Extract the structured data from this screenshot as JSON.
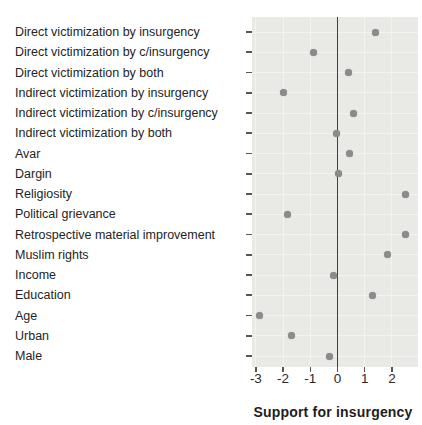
{
  "chart_data": {
    "type": "scatter",
    "subtype": "horizontal-dot-plot",
    "title": "",
    "xlabel": "Support for insurgency",
    "ylabel": "",
    "categories": [
      "Direct victimization by insurgency",
      "Direct victimization by c/insurgency",
      "Direct victimization by both",
      "Indirect victimization by insurgency",
      "Indirect victimization by c/insurgency",
      "Indirect victimization by both",
      "Avar",
      "Dargin",
      "Religiosity",
      "Political grievance",
      "Retrospective material improvement",
      "Muslim rights",
      "Income",
      "Education",
      "Age",
      "Urban",
      "Male"
    ],
    "values": [
      1.4,
      -0.9,
      0.4,
      -2.0,
      0.6,
      -0.05,
      0.45,
      0.05,
      2.5,
      -1.85,
      2.5,
      1.85,
      -0.15,
      1.3,
      -2.85,
      -1.7,
      -0.3
    ],
    "x_ticks": [
      -3,
      -2,
      -1,
      0,
      1,
      2
    ],
    "x_tick_labels": [
      "-3",
      "-2",
      "-1",
      "0",
      "1",
      "2"
    ],
    "xlim": [
      -3.15,
      2.95
    ],
    "reference_line_x": 0,
    "grid": "subtle white vertical and horizontal lines",
    "legend": "none",
    "colors": {
      "panel_bg": "#e9e9e6",
      "grid": "#f3f3ef",
      "dot": "#8b8b8b",
      "zero_line": "#3f3f3f",
      "tick_mark": "#555555",
      "text": "#242424"
    }
  }
}
